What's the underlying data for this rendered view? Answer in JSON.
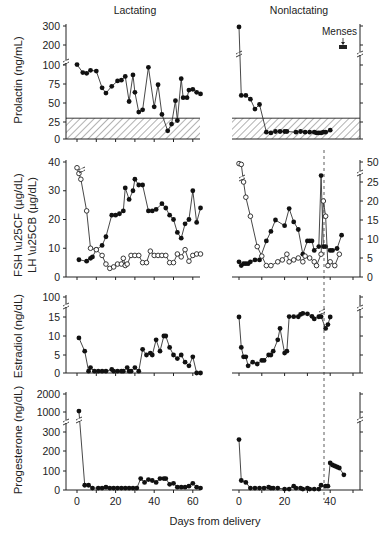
{
  "figure": {
    "titles": {
      "left": "Lactating",
      "right": "Nonlactating"
    },
    "xlabel": "Days from delivery",
    "annotation": {
      "menses": "Menses"
    },
    "ylabels": {
      "prolactin": "Prolactin (ng/mL)",
      "fsh": "FSH",
      "lh": "LH",
      "fsh_unit": "(µg/dL)",
      "lh_unit": "(µg/dL)",
      "estradiol": "Estradiol (ng/dL)",
      "progesterone": "Progesterone (ng/dL)"
    },
    "colors": {
      "ink": "#222222",
      "hatch": "#555555",
      "background": "#ffffff"
    }
  },
  "chart_data": [
    {
      "type": "line",
      "title": "Prolactin — Lactating",
      "panel": "prolactin-lactating",
      "xlabel": "Days from delivery",
      "ylabel": "Prolactin (ng/mL)",
      "yticks": [
        0,
        25,
        50,
        75,
        100,
        200,
        300
      ],
      "axis_break": [
        100,
        200
      ],
      "shaded_region": [
        0,
        30
      ],
      "xlim": [
        0,
        66
      ],
      "series": [
        {
          "name": "Prolactin",
          "marker": "filled",
          "x": [
            0,
            3,
            5,
            7,
            10,
            13,
            15,
            18,
            21,
            23,
            25,
            27,
            29,
            30,
            32,
            34,
            37,
            40,
            42,
            44,
            47,
            49,
            51,
            52,
            54,
            55,
            57,
            58,
            60,
            62,
            64
          ],
          "y": [
            102,
            90,
            89,
            93,
            92,
            70,
            63,
            72,
            79,
            80,
            85,
            52,
            87,
            64,
            38,
            41,
            97,
            45,
            74,
            35,
            12,
            22,
            53,
            27,
            82,
            57,
            57,
            67,
            68,
            64,
            62
          ]
        }
      ]
    },
    {
      "type": "line",
      "title": "Prolactin — Nonlactating",
      "panel": "prolactin-nonlactating",
      "xlabel": "Days from delivery",
      "ylabel": "Prolactin (ng/mL)",
      "axis_break": [
        100,
        200
      ],
      "shaded_region": [
        0,
        30
      ],
      "xlim": [
        0,
        52
      ],
      "annotations": [
        {
          "text": "Menses",
          "x": 46,
          "y": 250
        }
      ],
      "series": [
        {
          "name": "Prolactin",
          "marker": "filled",
          "x": [
            0,
            1,
            3,
            5,
            7,
            9,
            12,
            14,
            16,
            18,
            20,
            21,
            25,
            27,
            29,
            31,
            33,
            34,
            35,
            36,
            37,
            38,
            40
          ],
          "y": [
            295,
            60,
            60,
            55,
            42,
            48,
            10,
            9,
            11,
            11,
            11,
            11,
            10,
            11,
            10,
            10,
            10,
            9,
            9,
            9,
            10,
            10,
            13
          ]
        }
      ]
    },
    {
      "type": "line",
      "title": "FSH / LH — Lactating",
      "panel": "gonadotropins-lactating",
      "xlabel": "Days from delivery",
      "ylabel": "FSH ● LH ○ (µg/dL)",
      "yticks": [
        0,
        10,
        20,
        30,
        40
      ],
      "xlim": [
        0,
        66
      ],
      "series": [
        {
          "name": "FSH",
          "marker": "filled",
          "x": [
            1,
            5,
            7,
            8,
            10,
            13,
            15,
            18,
            20,
            22,
            24,
            25,
            27,
            29,
            30,
            32,
            34,
            37,
            39,
            41,
            44,
            46,
            48,
            50,
            52,
            54,
            56,
            58,
            60,
            62,
            64
          ],
          "y": [
            6,
            5.5,
            6.5,
            7,
            9.5,
            11,
            14,
            21.5,
            21.5,
            22,
            23,
            31,
            27,
            30,
            34,
            32,
            32,
            23,
            23,
            23.5,
            25.5,
            24,
            21.5,
            20,
            15.5,
            13.5,
            18.5,
            20,
            30,
            19,
            24
          ]
        },
        {
          "name": "LH",
          "marker": "open",
          "x": [
            0,
            1,
            2,
            5,
            7,
            10,
            13,
            15,
            17,
            19,
            21,
            23,
            24,
            25,
            26,
            28,
            30,
            32,
            34,
            36,
            38,
            40,
            42,
            44,
            46,
            48,
            50,
            52,
            54,
            56,
            58,
            60,
            62,
            64
          ],
          "y": [
            38,
            36,
            34,
            23,
            10,
            9.5,
            7.5,
            4.5,
            3,
            3.5,
            4.5,
            4.5,
            6.5,
            4,
            4.5,
            7.5,
            7.5,
            7.5,
            5,
            5,
            9,
            7.5,
            7.5,
            7.5,
            7.5,
            5,
            5,
            8,
            7,
            9.5,
            5.5,
            7.5,
            8,
            8
          ]
        }
      ]
    },
    {
      "type": "line",
      "title": "FSH / LH — Nonlactating",
      "panel": "gonadotropins-nonlactating",
      "xlabel": "Days from delivery",
      "ylabel": "(µg/dL)",
      "yticks": [
        0,
        5,
        10,
        15,
        20,
        25,
        50
      ],
      "axis_break": [
        25,
        50
      ],
      "xlim": [
        0,
        52
      ],
      "series": [
        {
          "name": "FSH",
          "marker": "filled",
          "x": [
            0,
            1,
            2,
            3,
            4,
            5,
            7,
            9,
            12,
            14,
            16,
            20,
            22,
            24,
            26,
            28,
            30,
            31,
            32,
            33,
            35,
            36,
            37,
            38,
            40,
            41,
            43,
            45
          ],
          "y": [
            4,
            3,
            3.5,
            3.5,
            3.5,
            4,
            4.5,
            4.5,
            9.5,
            12,
            15,
            13.5,
            18,
            14.5,
            12.5,
            6,
            9.5,
            9.5,
            9.5,
            7,
            8,
            33,
            8,
            8,
            7,
            7,
            7.5,
            11
          ]
        },
        {
          "name": "LH",
          "marker": "open",
          "x": [
            0,
            1,
            2,
            3,
            5,
            8,
            10,
            12,
            14,
            17,
            19,
            21,
            22,
            24,
            26,
            28,
            29,
            31,
            33,
            34,
            36,
            37,
            38,
            39,
            40,
            42,
            44
          ],
          "y": [
            48,
            47,
            25,
            21,
            16,
            8,
            5.5,
            3,
            3,
            4,
            4.5,
            6,
            4,
            4.5,
            5,
            4,
            5.5,
            5,
            4,
            3,
            6,
            20,
            16,
            3,
            4,
            3,
            6
          ]
        }
      ]
    },
    {
      "type": "line",
      "title": "Estradiol — Lactating",
      "panel": "estradiol-lactating",
      "xlabel": "Days from delivery",
      "ylabel": "Estradiol (ng/dL)",
      "yticks": [
        0,
        5,
        10,
        15,
        100
      ],
      "axis_break": [
        15,
        100
      ],
      "xlim": [
        0,
        66
      ],
      "series": [
        {
          "name": "Estradiol",
          "marker": "filled",
          "x": [
            1,
            4,
            6,
            7,
            9,
            11,
            13,
            15,
            18,
            19,
            21,
            23,
            24,
            26,
            27,
            28,
            30,
            32,
            34,
            36,
            38,
            39,
            41,
            43,
            45,
            46,
            48,
            50,
            52,
            54,
            56,
            58,
            60,
            62,
            64
          ],
          "y": [
            9.5,
            6,
            0.5,
            1.5,
            0.5,
            0.5,
            0.5,
            0.5,
            1,
            0.5,
            0.5,
            0.5,
            0.5,
            1.5,
            0.5,
            0.5,
            1.5,
            0.5,
            6.5,
            5,
            5.5,
            5,
            9,
            6,
            10,
            10,
            7,
            5,
            4,
            5,
            3,
            2,
            4.5,
            0,
            0
          ]
        }
      ]
    },
    {
      "type": "line",
      "title": "Estradiol — Nonlactating",
      "panel": "estradiol-nonlactating",
      "xlabel": "Days from delivery",
      "ylabel": "Estradiol (ng/dL)",
      "axis_break": [
        15,
        100
      ],
      "xlim": [
        0,
        52
      ],
      "series": [
        {
          "name": "Estradiol",
          "marker": "filled",
          "x": [
            0,
            1,
            2,
            3,
            4,
            6,
            8,
            10,
            11,
            13,
            14,
            15,
            17,
            18,
            20,
            21,
            22,
            24,
            26,
            27,
            28,
            30,
            32,
            33,
            35,
            36,
            38,
            39,
            40
          ],
          "y": [
            15,
            7,
            4.5,
            4.5,
            2,
            3,
            2.5,
            3.5,
            3.5,
            5,
            5,
            6,
            9,
            12,
            5.5,
            6,
            17,
            16.5,
            16,
            26,
            30,
            28.5,
            18,
            14.5,
            16,
            16.5,
            12,
            13,
            15
          ]
        }
      ]
    },
    {
      "type": "line",
      "title": "Progesterone — Lactating",
      "panel": "progesterone-lactating",
      "xlabel": "Days from delivery",
      "ylabel": "Progesterone (ng/dL)",
      "yticks": [
        0,
        100,
        200,
        300,
        1000,
        2000
      ],
      "axis_break": [
        300,
        1000
      ],
      "xlim": [
        0,
        66
      ],
      "series": [
        {
          "name": "Progesterone",
          "marker": "filled",
          "x": [
            1,
            4,
            6,
            8,
            11,
            13,
            15,
            17,
            19,
            21,
            23,
            25,
            27,
            29,
            31,
            33,
            35,
            37,
            39,
            41,
            43,
            45,
            46,
            48,
            50,
            52,
            54,
            56,
            58,
            60,
            62,
            64
          ],
          "y": [
            1050,
            25,
            25,
            10,
            10,
            10,
            15,
            10,
            10,
            10,
            10,
            10,
            10,
            10,
            10,
            60,
            40,
            55,
            50,
            40,
            60,
            60,
            60,
            30,
            35,
            15,
            15,
            15,
            20,
            35,
            15,
            10
          ]
        }
      ]
    },
    {
      "type": "line",
      "title": "Progesterone — Nonlactating",
      "panel": "progesterone-nonlactating",
      "xlabel": "Days from delivery",
      "ylabel": "Progesterone (ng/dL)",
      "axis_break": [
        300,
        1000
      ],
      "xlim": [
        0,
        52
      ],
      "series": [
        {
          "name": "Progesterone",
          "marker": "filled",
          "x": [
            0,
            1,
            3,
            5,
            7,
            9,
            11,
            13,
            14,
            15,
            17,
            20,
            22,
            24,
            25,
            27,
            28,
            30,
            31,
            33,
            35,
            36,
            38,
            39,
            40,
            41,
            42,
            43,
            44,
            46
          ],
          "y": [
            260,
            50,
            40,
            10,
            10,
            10,
            10,
            15,
            10,
            10,
            10,
            5,
            5,
            20,
            10,
            10,
            5,
            10,
            5,
            5,
            5,
            25,
            20,
            20,
            140,
            130,
            125,
            120,
            115,
            80
          ]
        }
      ]
    }
  ],
  "axes": {
    "left_x_ticks": [
      "0",
      "20",
      "40",
      "60"
    ],
    "right_x_ticks": [
      "0",
      "20",
      "40"
    ],
    "prolactin_ticks": [
      "0",
      "25",
      "50",
      "75",
      "100",
      "200",
      "300"
    ],
    "gonadotropin_left_ticks": [
      "0",
      "10",
      "20",
      "30",
      "40"
    ],
    "gonadotropin_right_ticks": [
      "0",
      "5",
      "10",
      "15",
      "20",
      "25",
      "50"
    ],
    "estradiol_ticks": [
      "0",
      "5",
      "10",
      "15",
      "100"
    ],
    "progesterone_ticks": [
      "0",
      "100",
      "200",
      "300",
      "1000",
      "2000"
    ]
  }
}
